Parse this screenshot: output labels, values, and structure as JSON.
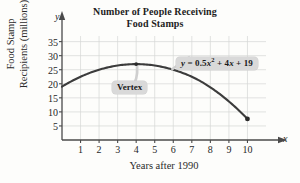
{
  "chart_data": {
    "type": "line",
    "title": "Number of People Receiving Food Stamps",
    "title_line1": "Number of People Receiving",
    "title_line2": "Food Stamps",
    "xlabel": "Years after 1990",
    "ylabel": "Food Stamp Recipients (millions)",
    "ylabel_line1": "Food Stamp",
    "ylabel_line2": "Recipients (millions)",
    "x_axis_letter": "x",
    "y_axis_letter": "y",
    "grid": true,
    "legend": "none",
    "xlim": [
      0,
      11
    ],
    "ylim": [
      0,
      37
    ],
    "xticks": [
      1,
      2,
      3,
      4,
      5,
      6,
      7,
      8,
      9,
      10
    ],
    "yticks": [
      5,
      10,
      15,
      20,
      25,
      30,
      35
    ],
    "equation_label": "y = 0.5x² + 4x + 19",
    "equation_parts": {
      "lhs": "y",
      "eq": "=",
      "a": "0.5",
      "var": "x",
      "power": "2",
      "plus1": "+ 4",
      "var2": "x",
      "plus2": "+ 19"
    },
    "vertex_label": "Vertex",
    "vertex_point": {
      "x": 4,
      "y": 27
    },
    "endpoint_marker": {
      "x": 10,
      "y": 7.5
    },
    "x": [
      0,
      1,
      2,
      3,
      4,
      5,
      6,
      7,
      8,
      9,
      10
    ],
    "values": [
      19,
      22.5,
      25,
      26.5,
      27,
      26.5,
      25,
      22.5,
      19,
      14.5,
      7.5
    ],
    "curve_color": "#3c3c3c",
    "grid_color": "#d5d7d5",
    "axis_color": "#4a4a4a",
    "callout_bg": "#d9d9d9",
    "plot_bg": "#fdfdfb"
  }
}
